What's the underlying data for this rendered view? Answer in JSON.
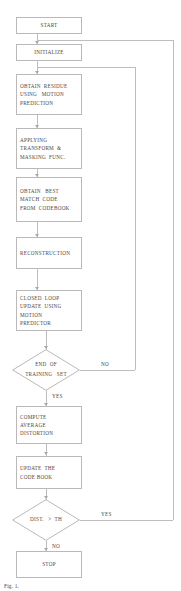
{
  "figure": {
    "type": "flowchart",
    "caption": "Fig. 1.",
    "accent_color": "#b9b9b9",
    "text_color": "#4a4a4a",
    "background": "#ffffff"
  },
  "nodes": [
    {
      "id": "start",
      "shape": "process",
      "align": "center",
      "lines": [
        "START"
      ],
      "x": 16,
      "y": 17,
      "w": 66,
      "h": 17
    },
    {
      "id": "initialize",
      "shape": "process",
      "align": "center",
      "lines": [
        "INITIALIZE"
      ],
      "x": 16,
      "y": 44,
      "w": 66,
      "h": 17
    },
    {
      "id": "obtain-residue",
      "shape": "process",
      "align": "left",
      "lines": [
        "OBTAIN  RESIDUE",
        "USING   MOTION",
        "PREDICTION"
      ],
      "x": 16,
      "y": 74,
      "w": 66,
      "h": 41
    },
    {
      "id": "applying-transform",
      "shape": "process",
      "align": "left",
      "lines": [
        "APPLYING",
        "TRANSFORM  &",
        "MASKING  FUNC."
      ],
      "x": 16,
      "y": 128,
      "w": 66,
      "h": 41
    },
    {
      "id": "obtain-best-match",
      "shape": "process",
      "align": "left",
      "lines": [
        "OBTAIN   BEST",
        "MATCH  CODE",
        "FROM  CODEBOOK"
      ],
      "x": 16,
      "y": 177,
      "w": 66,
      "h": 45
    },
    {
      "id": "reconstruction",
      "shape": "process",
      "align": "left",
      "lines": [
        "RECONSTRUCTION"
      ],
      "x": 16,
      "y": 237,
      "w": 66,
      "h": 32
    },
    {
      "id": "closed-loop-update",
      "shape": "process",
      "align": "left",
      "lines": [
        "CLOSED  LOOP",
        "UPDATE  USING",
        "MOTION",
        "PREDICTOR"
      ],
      "x": 16,
      "y": 290,
      "w": 66,
      "h": 41
    },
    {
      "id": "compute-average-distortion",
      "shape": "process",
      "align": "left",
      "lines": [
        "COMPUTE",
        "AVERAGE",
        "DISTORTION"
      ],
      "x": 16,
      "y": 406,
      "w": 66,
      "h": 38
    },
    {
      "id": "update-codebook",
      "shape": "process",
      "align": "left",
      "lines": [
        "UPDATE  THE",
        "CODE BOOK"
      ],
      "x": 16,
      "y": 456,
      "w": 66,
      "h": 33
    },
    {
      "id": "stop",
      "shape": "process",
      "align": "center",
      "lines": [
        "STOP"
      ],
      "x": 16,
      "y": 551,
      "w": 66,
      "h": 27
    }
  ],
  "decisions": [
    {
      "id": "end-of-training-set",
      "lines": [
        "END  OF",
        "TRAINING   SET"
      ],
      "x": 12,
      "y": 349,
      "w": 68,
      "h": 42,
      "yes_label": "YES",
      "no_label": "NO"
    },
    {
      "id": "dist-gt-th",
      "lines": [
        "DIST.   >  TH"
      ],
      "x": 12,
      "y": 499,
      "w": 68,
      "h": 42,
      "yes_label": "YES",
      "no_label": "NO"
    }
  ],
  "branch_labels": [
    {
      "id": "end-training-no",
      "text": "NO",
      "x": 101,
      "y": 361
    },
    {
      "id": "end-training-yes",
      "text": "YES",
      "x": 52,
      "y": 393
    },
    {
      "id": "dist-yes",
      "text": "YES",
      "x": 101,
      "y": 511
    },
    {
      "id": "dist-no",
      "text": "NO",
      "x": 52,
      "y": 543
    }
  ],
  "edges": [
    {
      "id": "start-to-initialize",
      "from": "start",
      "to": "initialize"
    },
    {
      "id": "initialize-to-obtain-residue",
      "from": "initialize",
      "to": "obtain-residue"
    },
    {
      "id": "residue-to-transform",
      "from": "obtain-residue",
      "to": "applying-transform"
    },
    {
      "id": "transform-to-best-match",
      "from": "applying-transform",
      "to": "obtain-best-match"
    },
    {
      "id": "best-match-to-reconstruction",
      "from": "obtain-best-match",
      "to": "reconstruction"
    },
    {
      "id": "reconstruction-to-closed-loop",
      "from": "reconstruction",
      "to": "closed-loop-update"
    },
    {
      "id": "closed-loop-to-end-training",
      "from": "closed-loop-update",
      "to": "end-of-training-set"
    },
    {
      "id": "end-training-yes-to-compute",
      "from": "end-of-training-set",
      "to": "compute-average-distortion",
      "label": "YES"
    },
    {
      "id": "end-training-no-feedback",
      "from": "end-of-training-set",
      "to": "obtain-residue",
      "label": "NO"
    },
    {
      "id": "compute-to-update-codebook",
      "from": "compute-average-distortion",
      "to": "update-codebook"
    },
    {
      "id": "update-codebook-to-dist",
      "from": "update-codebook",
      "to": "dist-gt-th"
    },
    {
      "id": "dist-yes-feedback",
      "from": "dist-gt-th",
      "to": "initialize",
      "label": "YES"
    },
    {
      "id": "dist-no-to-stop",
      "from": "dist-gt-th",
      "to": "stop",
      "label": "NO"
    }
  ]
}
